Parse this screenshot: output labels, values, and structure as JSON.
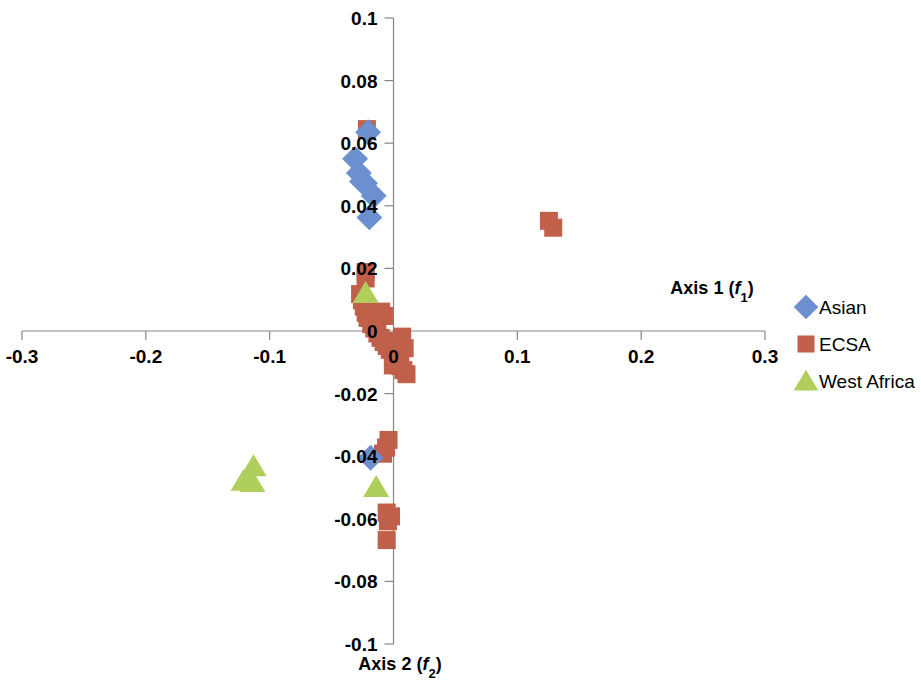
{
  "chart_data": {
    "type": "scatter",
    "title": "",
    "xlabel": "Axis 1 (f1)",
    "ylabel": "Axis 2 (f2)",
    "xlabel_parts": {
      "main": "Axis 1 (",
      "italic": "f",
      "sub": "1",
      "close": ")"
    },
    "ylabel_parts": {
      "main": "Axis 2 (",
      "italic": "f",
      "sub": "2",
      "close": ")"
    },
    "xlim": [
      -0.3,
      0.3
    ],
    "ylim": [
      -0.1,
      0.1
    ],
    "xticks": [
      -0.3,
      -0.2,
      -0.1,
      0,
      0.1,
      0.2,
      0.3
    ],
    "xtick_labels": [
      "-0.3",
      "-0.2",
      "-0.1",
      "0",
      "0.1",
      "0.2",
      "0.3"
    ],
    "yticks": [
      -0.1,
      -0.08,
      -0.06,
      -0.04,
      -0.02,
      0,
      0.02,
      0.04,
      0.06,
      0.08,
      0.1
    ],
    "ytick_labels": [
      "-0.1",
      "-0.08",
      "-0.06",
      "-0.04",
      "-0.02",
      "0",
      "0.02",
      "0.04",
      "0.06",
      "0.08",
      "0.1"
    ],
    "grid": false,
    "legend_position": "right",
    "series": [
      {
        "name": "Asian",
        "marker": "diamond",
        "color": "#6C8FD0",
        "points": [
          [
            -0.0205,
            0.0635
          ],
          [
            -0.031,
            0.055
          ],
          [
            -0.028,
            0.0505
          ],
          [
            -0.0255,
            0.0478
          ],
          [
            -0.023,
            0.0472
          ],
          [
            -0.016,
            0.0432
          ],
          [
            -0.0195,
            0.0363
          ],
          [
            -0.0185,
            -0.0405
          ]
        ]
      },
      {
        "name": "ECSA",
        "marker": "square",
        "color": "#C0604A",
        "points": [
          [
            -0.0215,
            0.0645
          ],
          [
            -0.0225,
            0.0188
          ],
          [
            -0.0225,
            0.0168
          ],
          [
            -0.027,
            0.0118
          ],
          [
            -0.0255,
            0.0098
          ],
          [
            -0.024,
            0.0078
          ],
          [
            -0.0225,
            0.0058
          ],
          [
            -0.021,
            0.0042
          ],
          [
            -0.01,
            0.0062
          ],
          [
            -0.0075,
            0.0048
          ],
          [
            -0.018,
            0.0022
          ],
          [
            -0.0155,
            0.0008
          ],
          [
            -0.013,
            -0.0008
          ],
          [
            -0.0105,
            -0.0022
          ],
          [
            -0.008,
            -0.0035
          ],
          [
            -0.0055,
            -0.0048
          ],
          [
            -0.003,
            -0.006
          ],
          [
            -0.0005,
            -0.0072
          ],
          [
            0.002,
            -0.0032
          ],
          [
            0.0045,
            -0.0045
          ],
          [
            0.007,
            -0.0018
          ],
          [
            0.009,
            -0.0055
          ],
          [
            0.0045,
            -0.0085
          ],
          [
            0.002,
            -0.0098
          ],
          [
            -0.0005,
            -0.011
          ],
          [
            0.0055,
            -0.0112
          ],
          [
            0.008,
            -0.0125
          ],
          [
            0.0105,
            -0.0138
          ],
          [
            0.1255,
            0.0352
          ],
          [
            0.129,
            0.033
          ],
          [
            -0.004,
            -0.0348
          ],
          [
            -0.006,
            -0.0372
          ],
          [
            -0.0085,
            -0.0392
          ],
          [
            -0.0055,
            -0.058
          ],
          [
            -0.002,
            -0.0592
          ],
          [
            -0.0045,
            -0.0608
          ],
          [
            -0.0055,
            -0.0668
          ]
        ]
      },
      {
        "name": "West Africa",
        "marker": "triangle",
        "color": "#AFCE5C",
        "points": [
          [
            -0.0225,
            0.0122
          ],
          [
            -0.113,
            -0.0432
          ],
          [
            -0.121,
            -0.0478
          ],
          [
            -0.114,
            -0.0482
          ],
          [
            -0.014,
            -0.0498
          ]
        ]
      }
    ]
  },
  "legend": {
    "items": [
      {
        "label": "Asian",
        "marker": "diamond",
        "color": "#6C8FD0"
      },
      {
        "label": "ECSA",
        "marker": "square",
        "color": "#C0604A"
      },
      {
        "label": "West Africa",
        "marker": "triangle",
        "color": "#AFCE5C"
      }
    ]
  }
}
